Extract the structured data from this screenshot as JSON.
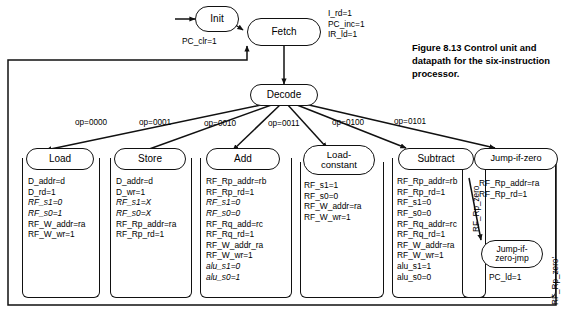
{
  "figure": {
    "caption": "Figure 8.13 Control unit and datapath for the six-instruction processor."
  },
  "states": {
    "init": {
      "label": "Init",
      "actions": [
        "PC_clr=1"
      ]
    },
    "fetch": {
      "label": "Fetch",
      "actions": [
        "I_rd=1",
        "PC_inc=1",
        "IR_ld=1"
      ]
    },
    "decode": {
      "label": "Decode",
      "actions": []
    },
    "load": {
      "label": "Load",
      "actions": [
        "D_addr=d",
        "D_rd=1",
        "RF_s1=0",
        "RF_s0=1",
        "RF_W_addr=ra",
        "RF_W_wr=1"
      ],
      "italic": [
        false,
        false,
        true,
        true,
        false,
        false
      ]
    },
    "store": {
      "label": "Store",
      "actions": [
        "D_addr=d",
        "D_wr=1",
        "RF_s1=X",
        "RF_s0=X",
        "RF_Rp_addr=ra",
        "RF_Rp_rd=1"
      ],
      "italic": [
        false,
        false,
        true,
        true,
        false,
        false
      ]
    },
    "add": {
      "label": "Add",
      "actions": [
        "RF_Rp_addr=rb",
        "RF_Rp_rd=1",
        "RF_s1=0",
        "RF_s0=0",
        "RF_Rq_add=rc",
        "RF_Rq_rd=1",
        "RF_W_addr_ra",
        "RF_W_wr=1",
        "alu_s1=0",
        "alu_s0=1"
      ],
      "italic": [
        false,
        false,
        true,
        true,
        false,
        false,
        false,
        false,
        true,
        true
      ]
    },
    "load_constant": {
      "label": "Load-\nconstant",
      "actions": [
        "RF_s1=1",
        "RF_s0=0",
        "RF_W_addr=ra",
        "RF_W_wr=1"
      ],
      "italic": [
        false,
        false,
        false,
        false
      ]
    },
    "subtract": {
      "label": "Subtract",
      "actions": [
        "RF_Rp_addr=rb",
        "RF_Rp_rd=1",
        "RF_s1=0",
        "RF_s0=0",
        "RF_Rq_addr=rc",
        "RF_Rq_rd=1",
        "RF_W_addr=ra",
        "RF_W_wr=1",
        "alu_s1=1",
        "alu_s0=0"
      ],
      "italic": [
        false,
        false,
        false,
        false,
        false,
        false,
        false,
        false,
        false,
        false
      ]
    },
    "jump_if_zero": {
      "label": "Jump-if-zero",
      "actions": [
        "RF_Rp_addr=ra",
        "RF_Rp_rd=1"
      ],
      "italic": [
        false,
        false
      ]
    },
    "jump_if_zero_jmp": {
      "label": "Jump-if-\nzero-jmp",
      "actions": [
        "PC_ld=1"
      ],
      "italic": [
        false
      ]
    }
  },
  "transitions": {
    "op_0000": "op=0000",
    "op_0001": "op=0001",
    "op_0010": "op=0010",
    "op_0011": "op=0011",
    "op_0100": "op=0100",
    "op_0101": "op=0101",
    "rf_rp_zero": "RF_Rp_zero",
    "rf_rp_zero_not": "RF_Rp_zero'"
  },
  "colors": {
    "stroke": "#111111",
    "background": "#ffffff",
    "text": "#000000"
  }
}
